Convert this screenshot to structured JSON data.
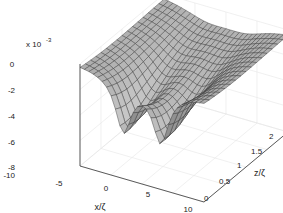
{
  "chart_data": {
    "type": "surface",
    "title": "",
    "xlabel": "x/ζ",
    "ylabel": "z/ζ",
    "zlabel": "",
    "z_multiplier_label": "x 10",
    "z_multiplier_exponent": "-3",
    "x_ticks": [
      "-10",
      "-5",
      "0",
      "5",
      "10"
    ],
    "x_tick_values": [
      -10,
      -5,
      0,
      5,
      10
    ],
    "y_ticks": [
      "0",
      "0.5",
      "1",
      "1.5",
      "2"
    ],
    "y_tick_values": [
      0,
      0.5,
      1,
      1.5,
      2
    ],
    "z_ticks": [
      "0",
      "-2",
      "-4",
      "-6",
      "-8"
    ],
    "z_tick_values": [
      0,
      -2,
      -4,
      -6,
      -8
    ],
    "xlim": [
      -10,
      10
    ],
    "ylim": [
      0,
      2
    ],
    "zlim": [
      -8,
      0
    ],
    "grid": true,
    "surface": {
      "description": "Two Lorentzian-like troughs in x, centered near x=-3 and x=+3, deepest (about -7.6e-3) at z=0, flattening toward 0 as z increases to 2",
      "trough_centers_x": [
        -3,
        3
      ],
      "min_value_at_z0": -7.6,
      "value_far_from_troughs": 0,
      "face_color": "#b4b4b4",
      "edge_color": "#3a3a3a"
    }
  }
}
